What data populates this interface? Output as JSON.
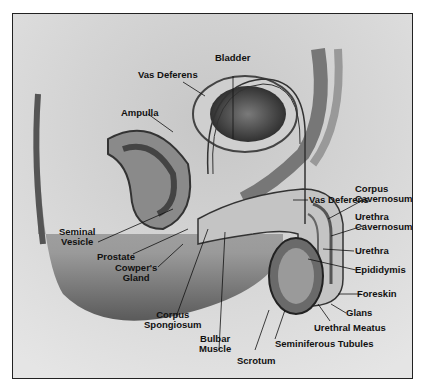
{
  "diagram": {
    "labels": {
      "bladder": "Bladder",
      "vas_deferens_top": "Vas Deferens",
      "ampulla": "Ampulla",
      "vas_deferens_right": "Vas Deferens",
      "corpus_cavernosum_1": "Corpus",
      "corpus_cavernosum_2": "Cavernosum",
      "urethra_cavernosum_1": "Urethra",
      "urethra_cavernosum_2": "Cavernosum",
      "urethra": "Urethra",
      "epididymis": "Epididymis",
      "foreskin": "Foreskin",
      "glans": "Glans",
      "urethral_meatus": "Urethral Meatus",
      "seminiferous_tubules": "Seminiferous Tubules",
      "scrotum": "Scrotum",
      "bulbar_muscle_1": "Bulbar",
      "bulbar_muscle_2": "Muscle",
      "corpus_spongiosum_1": "Corpus",
      "corpus_spongiosum_2": "Spongiosum",
      "cowpers_gland_1": "Cowper's",
      "cowpers_gland_2": "Gland",
      "prostate": "Prostate",
      "seminal_vesicle_1": "Seminal",
      "seminal_vesicle_2": "Vesicle"
    }
  }
}
